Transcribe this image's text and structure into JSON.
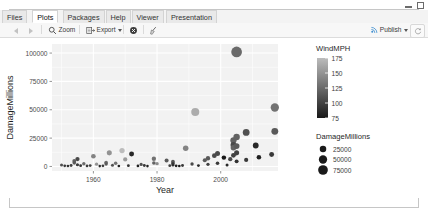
{
  "window": {
    "controls": [
      {
        "name": "minimize",
        "icon": "minimize-icon"
      },
      {
        "name": "maximize",
        "icon": "maximize-icon"
      }
    ]
  },
  "tabs": [
    {
      "label": "Files",
      "active": false
    },
    {
      "label": "Plots",
      "active": true
    },
    {
      "label": "Packages",
      "active": false
    },
    {
      "label": "Help",
      "active": false
    },
    {
      "label": "Viewer",
      "active": false
    },
    {
      "label": "Presentation",
      "active": false
    }
  ],
  "toolbar": {
    "back_icon": "back-arrow-icon",
    "forward_icon": "forward-arrow-icon",
    "zoom_label": "Zoom",
    "zoom_icon": "magnifier-icon",
    "export_label": "Export",
    "export_icon": "export-icon",
    "export_caret": "chevron-down-icon",
    "remove_icon": "remove-plot-icon",
    "clear_icon": "broom-clear-icon",
    "publish_label": "Publish",
    "publish_icon": "publish-icon",
    "publish_caret": "chevron-down-icon",
    "refresh_icon": "refresh-icon"
  },
  "chart_data": {
    "type": "scatter",
    "title": "",
    "xlabel": "Year",
    "ylabel": "DamageMillions",
    "xlim": [
      1947,
      2018
    ],
    "ylim": [
      -4000,
      108000
    ],
    "xticks": [
      1960,
      1980,
      2000
    ],
    "yticks": [
      0,
      25000,
      50000,
      75000,
      100000
    ],
    "ytick_labels": [
      "0",
      "25000",
      "50000",
      "75000",
      "100000"
    ],
    "xtick_labels": [
      "1960",
      "1980",
      "2000"
    ],
    "grid": true,
    "panel_background": "#f2f2f2",
    "grid_color": "#ffffff",
    "legends": [
      {
        "name": "WindMPH",
        "type": "colorbar",
        "title": "WindMPH",
        "ticks": [
          175,
          150,
          125,
          100,
          75
        ],
        "tick_labels": [
          "175",
          "150",
          "125",
          "100",
          "75"
        ],
        "gradient_low_color": "#132b43",
        "gradient_high_color": "#bcbcbc",
        "low_value": 75,
        "high_value": 175
      },
      {
        "name": "DamageMillions",
        "type": "size",
        "title": "DamageMillions",
        "breaks": [
          25000,
          50000,
          75000
        ],
        "break_labels": [
          "25000",
          "50000",
          "75000"
        ],
        "point_color": "#1a1a1a"
      }
    ],
    "series": [
      {
        "name": "hurricanes",
        "encodings": {
          "x": "Year",
          "y": "DamageMillions",
          "size": "DamageMillions",
          "color": "WindMPH"
        },
        "points": [
          {
            "x": 1950,
            "y": 1200,
            "w": 110
          },
          {
            "x": 1951,
            "y": 600,
            "w": 95
          },
          {
            "x": 1952,
            "y": 400,
            "w": 90
          },
          {
            "x": 1953,
            "y": 900,
            "w": 100
          },
          {
            "x": 1954,
            "y": 4800,
            "w": 120
          },
          {
            "x": 1954,
            "y": 3200,
            "w": 115
          },
          {
            "x": 1955,
            "y": 6500,
            "w": 105
          },
          {
            "x": 1955,
            "y": 1500,
            "w": 95
          },
          {
            "x": 1956,
            "y": 700,
            "w": 90
          },
          {
            "x": 1957,
            "y": 2400,
            "w": 125
          },
          {
            "x": 1958,
            "y": 500,
            "w": 95
          },
          {
            "x": 1959,
            "y": 800,
            "w": 100
          },
          {
            "x": 1960,
            "y": 9000,
            "w": 140
          },
          {
            "x": 1961,
            "y": 2000,
            "w": 150
          },
          {
            "x": 1962,
            "y": 300,
            "w": 85
          },
          {
            "x": 1963,
            "y": 600,
            "w": 95
          },
          {
            "x": 1964,
            "y": 3500,
            "w": 125
          },
          {
            "x": 1964,
            "y": 2200,
            "w": 115
          },
          {
            "x": 1965,
            "y": 12000,
            "w": 150
          },
          {
            "x": 1966,
            "y": 1100,
            "w": 110
          },
          {
            "x": 1967,
            "y": 2800,
            "w": 130
          },
          {
            "x": 1968,
            "y": 400,
            "w": 80
          },
          {
            "x": 1969,
            "y": 14000,
            "w": 175
          },
          {
            "x": 1970,
            "y": 6200,
            "w": 155
          },
          {
            "x": 1971,
            "y": 700,
            "w": 90
          },
          {
            "x": 1972,
            "y": 11000,
            "w": 85
          },
          {
            "x": 1974,
            "y": 500,
            "w": 80
          },
          {
            "x": 1975,
            "y": 1800,
            "w": 110
          },
          {
            "x": 1976,
            "y": 900,
            "w": 95
          },
          {
            "x": 1977,
            "y": 300,
            "w": 80
          },
          {
            "x": 1979,
            "y": 6800,
            "w": 130
          },
          {
            "x": 1979,
            "y": 3100,
            "w": 120
          },
          {
            "x": 1980,
            "y": 2500,
            "w": 145
          },
          {
            "x": 1983,
            "y": 5200,
            "w": 115
          },
          {
            "x": 1984,
            "y": 700,
            "w": 100
          },
          {
            "x": 1985,
            "y": 4200,
            "w": 115
          },
          {
            "x": 1985,
            "y": 2600,
            "w": 100
          },
          {
            "x": 1985,
            "y": 1400,
            "w": 90
          },
          {
            "x": 1986,
            "y": 600,
            "w": 80
          },
          {
            "x": 1987,
            "y": 400,
            "w": 75
          },
          {
            "x": 1988,
            "y": 900,
            "w": 95
          },
          {
            "x": 1989,
            "y": 16000,
            "w": 140
          },
          {
            "x": 1991,
            "y": 2200,
            "w": 105
          },
          {
            "x": 1992,
            "y": 48000,
            "w": 165
          },
          {
            "x": 1993,
            "y": 800,
            "w": 85
          },
          {
            "x": 1995,
            "y": 5500,
            "w": 115
          },
          {
            "x": 1996,
            "y": 7200,
            "w": 115
          },
          {
            "x": 1996,
            "y": 1900,
            "w": 100
          },
          {
            "x": 1998,
            "y": 9500,
            "w": 105
          },
          {
            "x": 1999,
            "y": 11500,
            "w": 105
          },
          {
            "x": 1999,
            "y": 2800,
            "w": 95
          },
          {
            "x": 2001,
            "y": 7800,
            "w": 70
          },
          {
            "x": 2002,
            "y": 1200,
            "w": 85
          },
          {
            "x": 2003,
            "y": 6400,
            "w": 105
          },
          {
            "x": 2004,
            "y": 23000,
            "w": 120
          },
          {
            "x": 2004,
            "y": 19000,
            "w": 105
          },
          {
            "x": 2004,
            "y": 16500,
            "w": 120
          },
          {
            "x": 2004,
            "y": 9800,
            "w": 100
          },
          {
            "x": 2005,
            "y": 101000,
            "w": 125
          },
          {
            "x": 2005,
            "y": 26000,
            "w": 120
          },
          {
            "x": 2005,
            "y": 18000,
            "w": 115
          },
          {
            "x": 2005,
            "y": 12000,
            "w": 100
          },
          {
            "x": 2005,
            "y": 4500,
            "w": 90
          },
          {
            "x": 2008,
            "y": 30000,
            "w": 110
          },
          {
            "x": 2008,
            "y": 5800,
            "w": 95
          },
          {
            "x": 2011,
            "y": 18500,
            "w": 85
          },
          {
            "x": 2012,
            "y": 8200,
            "w": 80
          },
          {
            "x": 2016,
            "y": 10500,
            "w": 95
          },
          {
            "x": 2017,
            "y": 52000,
            "w": 130
          },
          {
            "x": 2017,
            "y": 31000,
            "w": 115
          }
        ]
      }
    ]
  }
}
